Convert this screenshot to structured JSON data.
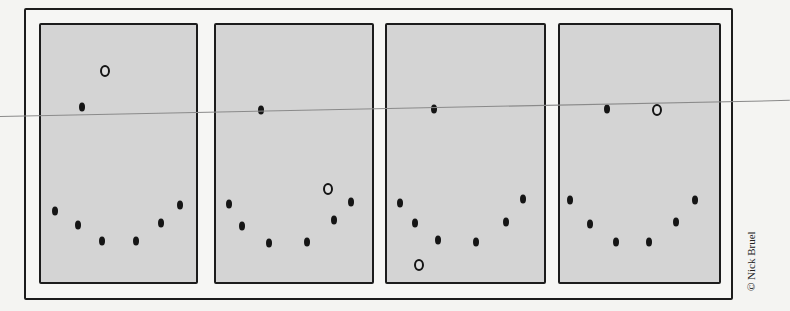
{
  "comic": {
    "credit": "© Nick Bruel",
    "colors": {
      "panel_fill": "#d4d4d4",
      "ink": "#151515",
      "paper": "#f4f4f2",
      "guide_line": "#8a8a8a"
    },
    "panels": [
      {
        "index": 1,
        "left": 39,
        "width": 159,
        "filled_dots": [
          [
            82,
            107
          ],
          [
            55,
            211
          ],
          [
            78,
            225
          ],
          [
            102,
            241
          ],
          [
            136,
            241
          ],
          [
            161,
            223
          ],
          [
            180,
            205
          ]
        ],
        "hollow_dots": [
          [
            105,
            71
          ]
        ]
      },
      {
        "index": 2,
        "left": 214,
        "width": 160,
        "filled_dots": [
          [
            261,
            110
          ],
          [
            229,
            204
          ],
          [
            242,
            226
          ],
          [
            269,
            243
          ],
          [
            307,
            242
          ],
          [
            334,
            220
          ],
          [
            351,
            202
          ]
        ],
        "hollow_dots": [
          [
            328,
            189
          ]
        ]
      },
      {
        "index": 3,
        "left": 385,
        "width": 161,
        "filled_dots": [
          [
            434,
            109
          ],
          [
            400,
            203
          ],
          [
            415,
            223
          ],
          [
            438,
            240
          ],
          [
            476,
            242
          ],
          [
            506,
            222
          ],
          [
            523,
            199
          ]
        ],
        "hollow_dots": [
          [
            419,
            265
          ]
        ]
      },
      {
        "index": 4,
        "left": 558,
        "width": 163,
        "filled_dots": [
          [
            607,
            109
          ],
          [
            570,
            200
          ],
          [
            590,
            224
          ],
          [
            616,
            242
          ],
          [
            649,
            242
          ],
          [
            676,
            222
          ],
          [
            695,
            200
          ]
        ],
        "hollow_dots": [
          [
            657,
            110
          ]
        ]
      }
    ]
  }
}
